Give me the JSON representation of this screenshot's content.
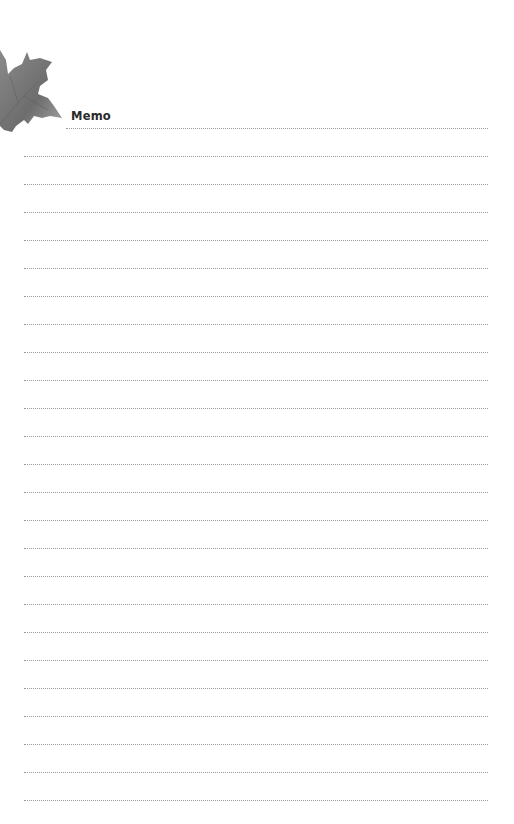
{
  "page": {
    "title": "Memo",
    "decoration": "maple-leaf-icon",
    "colors": {
      "background": "#ffffff",
      "rule": "#9a9a9a",
      "leaf": "#7a7a7a",
      "title": "#2a2a2a"
    },
    "lines": {
      "count": 25,
      "first_y": 128,
      "spacing": 28
    }
  }
}
